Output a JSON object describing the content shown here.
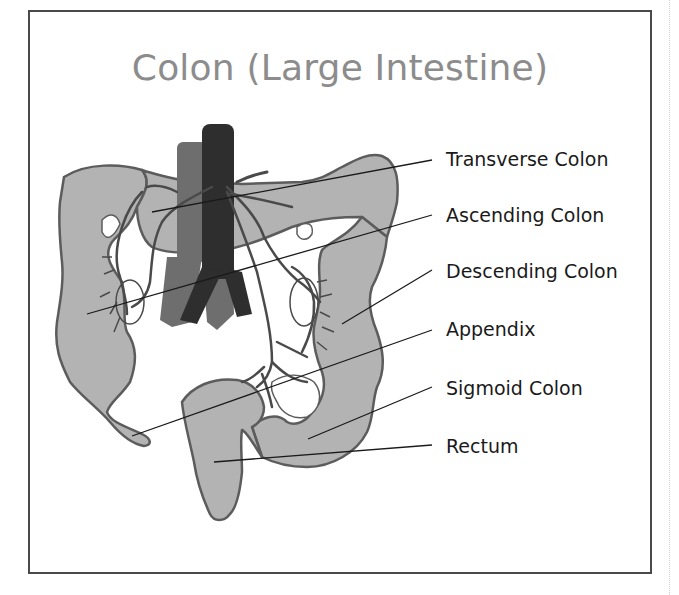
{
  "title": "Colon (Large Intestine)",
  "colors": {
    "frame": "#4a4a4a",
    "title": "#8c8c8c",
    "colon_fill": "#b3b3b3",
    "colon_outline": "#5c5c5c",
    "aorta": "#2e2e2e",
    "vena_cava": "#6e6e6e",
    "vessels": "#4a4a4a",
    "label_text": "#1a1a1a",
    "leader_line": "#1a1a1a"
  },
  "labels": [
    {
      "id": "transverse-colon",
      "text": "Transverse Colon",
      "y": 158
    },
    {
      "id": "ascending-colon",
      "text": "Ascending Colon",
      "y": 213
    },
    {
      "id": "descending-colon",
      "text": "Descending Colon",
      "y": 270
    },
    {
      "id": "appendix",
      "text": "Appendix",
      "y": 328
    },
    {
      "id": "sigmoid-colon",
      "text": "Sigmoid Colon",
      "y": 388
    },
    {
      "id": "rectum",
      "text": "Rectum",
      "y": 445
    }
  ]
}
